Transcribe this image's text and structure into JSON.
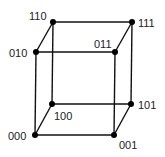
{
  "diagram": {
    "title": "",
    "type": "3-cube (binary hypercube)",
    "vertices": [
      {
        "id": "000",
        "label": "000"
      },
      {
        "id": "001",
        "label": "001"
      },
      {
        "id": "010",
        "label": "010"
      },
      {
        "id": "011",
        "label": "011"
      },
      {
        "id": "100",
        "label": "100"
      },
      {
        "id": "101",
        "label": "101"
      },
      {
        "id": "110",
        "label": "110"
      },
      {
        "id": "111",
        "label": "111"
      }
    ],
    "edges": [
      [
        "000",
        "001"
      ],
      [
        "010",
        "011"
      ],
      [
        "100",
        "101"
      ],
      [
        "110",
        "111"
      ],
      [
        "000",
        "010"
      ],
      [
        "001",
        "011"
      ],
      [
        "100",
        "110"
      ],
      [
        "101",
        "111"
      ],
      [
        "000",
        "100"
      ],
      [
        "001",
        "101"
      ],
      [
        "010",
        "110"
      ],
      [
        "011",
        "111"
      ]
    ],
    "colors": {
      "line": "#111111",
      "vertex": "#000000",
      "text": "#222222",
      "background": "#ffffff"
    }
  }
}
